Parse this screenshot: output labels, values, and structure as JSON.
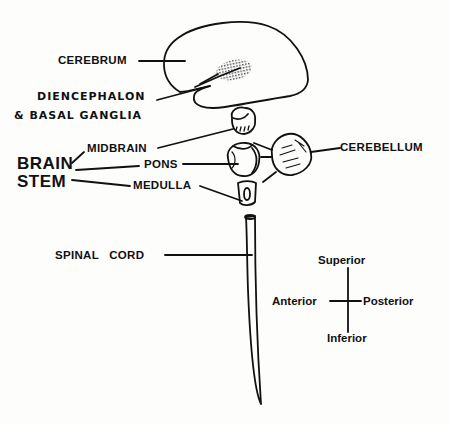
{
  "diagram": {
    "type": "anatomical-labeled-diagram",
    "structures": [
      {
        "id": "cerebrum",
        "label": "CEREBRUM"
      },
      {
        "id": "diencephalon",
        "label_line1": "DIENCEPHALON",
        "label_line2": "& BASAL GANGLIA"
      },
      {
        "id": "midbrain",
        "label": "MIDBRAIN"
      },
      {
        "id": "pons",
        "label": "PONS"
      },
      {
        "id": "medulla",
        "label": "MEDULLA"
      },
      {
        "id": "cerebellum",
        "label": "CEREBELLUM"
      },
      {
        "id": "spinal_cord",
        "label": "SPINAL   CORD"
      }
    ],
    "group": {
      "label_line1": "BRAIN",
      "label_line2": "STEM",
      "members": [
        "midbrain",
        "pons",
        "medulla"
      ]
    },
    "orientation": {
      "superior": "Superior",
      "inferior": "Inferior",
      "anterior": "Anterior",
      "posterior": "Posterior"
    },
    "colors": {
      "ink": "#111111",
      "background": "#fdfdfc",
      "stipple": "#555555"
    }
  }
}
